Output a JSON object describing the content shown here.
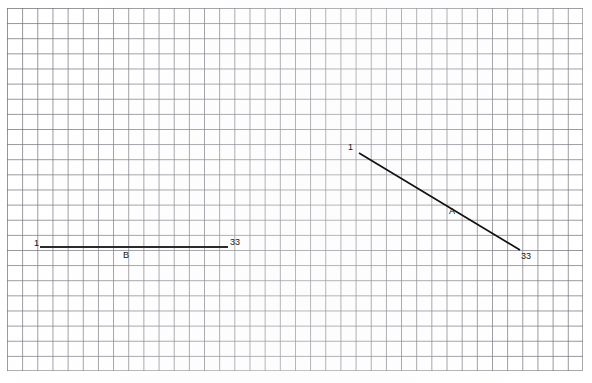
{
  "figure": {
    "title": "",
    "background_color": "#ffffff",
    "grid_color": "#6e6e76",
    "line_color": "#111111",
    "grid": {
      "visible": true,
      "cell_width_px": 15.16,
      "cell_height_px": 15.13,
      "columns": 38,
      "rows": 24,
      "origin_x_px": 7,
      "origin_y_px": 8,
      "width_px": 576,
      "height_px": 363
    }
  },
  "chart_data": {
    "type": "line",
    "title": "",
    "xlabel": "",
    "ylabel": "",
    "grid": true,
    "legend_position": "none",
    "annotations": [
      {
        "text": "1",
        "x": 352,
        "y": 147,
        "series": "A",
        "role": "start-endpoint-label"
      },
      {
        "text": "A",
        "x": 453,
        "y": 212,
        "series": "A",
        "role": "series-name-label"
      },
      {
        "text": "33",
        "x": 527,
        "y": 257,
        "series": "A",
        "role": "end-endpoint-label"
      },
      {
        "text": "1",
        "x": 37,
        "y": 243,
        "series": "B",
        "role": "start-endpoint-label"
      },
      {
        "text": "B",
        "x": 126,
        "y": 255,
        "series": "B",
        "role": "series-name-label"
      },
      {
        "text": "33",
        "x": 236,
        "y": 242,
        "series": "B",
        "role": "end-endpoint-label"
      }
    ],
    "series": [
      {
        "name": "A",
        "start_label": "1",
        "end_label": "33",
        "x": [
          359,
          520
        ],
        "y": [
          153,
          250
        ],
        "stroke": "#111111",
        "stroke_width": 1.6
      },
      {
        "name": "B",
        "start_label": "1",
        "end_label": "33",
        "x": [
          40,
          228
        ],
        "y": [
          247,
          247
        ],
        "stroke": "#2b2b2b",
        "stroke_width": 2.1
      }
    ]
  },
  "labels": {
    "line_a": {
      "start": "1",
      "name": "A",
      "end": "33"
    },
    "line_b": {
      "start": "1",
      "name": "B",
      "end": "33"
    }
  }
}
